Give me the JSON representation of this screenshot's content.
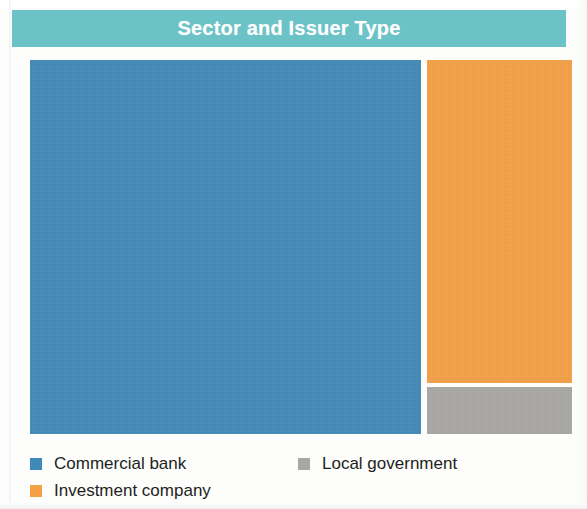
{
  "header": {
    "title": "Sector and Issuer Type",
    "bar_color": "#6CC3C7",
    "title_color": "#FFFFFF"
  },
  "legend": {
    "items": [
      {
        "label": "Commercial bank",
        "color": "#4189B8",
        "swatch_name": "legend-swatch-commercial-bank"
      },
      {
        "label": "Investment company",
        "color": "#F5A045",
        "swatch_name": "legend-swatch-investment-company"
      },
      {
        "label": "Local government",
        "color": "#A9A7A4",
        "swatch_name": "legend-swatch-local-government"
      }
    ]
  },
  "chart_data": {
    "type": "treemap",
    "title": "Sector and Issuer Type",
    "xlabel": "",
    "ylabel": "",
    "grid": false,
    "legend_position": "bottom",
    "categories": [
      "Commercial bank",
      "Investment company",
      "Local government"
    ],
    "values": [
      73.1,
      23.5,
      3.4
    ],
    "value_unit": "percent of total area",
    "colors": [
      "#4189B8",
      "#F5A045",
      "#A9A7A4"
    ],
    "layout": {
      "note": "Single large left tile; right column split into a tall tile above a short tile.",
      "tiles": [
        {
          "name": "Commercial bank",
          "x": 0,
          "y": 0,
          "width": 391,
          "height": 374,
          "color": "#4189B8"
        },
        {
          "name": "Investment company",
          "x": 397,
          "y": 0,
          "width": 145,
          "height": 323,
          "color": "#F5A045"
        },
        {
          "name": "Local government",
          "x": 397,
          "y": 327,
          "width": 145,
          "height": 47,
          "color": "#A9A7A4"
        }
      ]
    },
    "data_labels": []
  }
}
